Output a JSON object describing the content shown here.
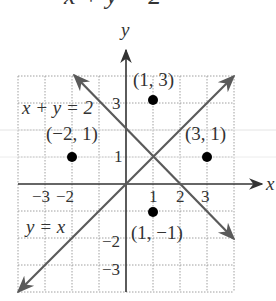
{
  "title_partial": "x + y = 2",
  "axes": {
    "x_label": "x",
    "y_label": "y",
    "x_ticks": [
      "−3",
      "−2",
      "1",
      "2",
      "3"
    ],
    "y_ticks": [
      "3",
      "1",
      "−2",
      "−3"
    ]
  },
  "lines": [
    {
      "label": "x + y = 2",
      "equation": "x + y = 2",
      "color": "#5a5a5a"
    },
    {
      "label": "y = x",
      "equation": "y = x",
      "color": "#5a5a5a"
    }
  ],
  "points": [
    {
      "label": "(1, 3)",
      "x": 1,
      "y": 3
    },
    {
      "label": "(−2, 1)",
      "x": -2,
      "y": 1
    },
    {
      "label": "(3, 1)",
      "x": 3,
      "y": 1
    },
    {
      "label": "(1, −1)",
      "x": 1,
      "y": -1
    }
  ],
  "colors": {
    "grid": "#9a9a9a",
    "axis": "#333333",
    "line": "#5a5a5a",
    "point": "#000000"
  }
}
